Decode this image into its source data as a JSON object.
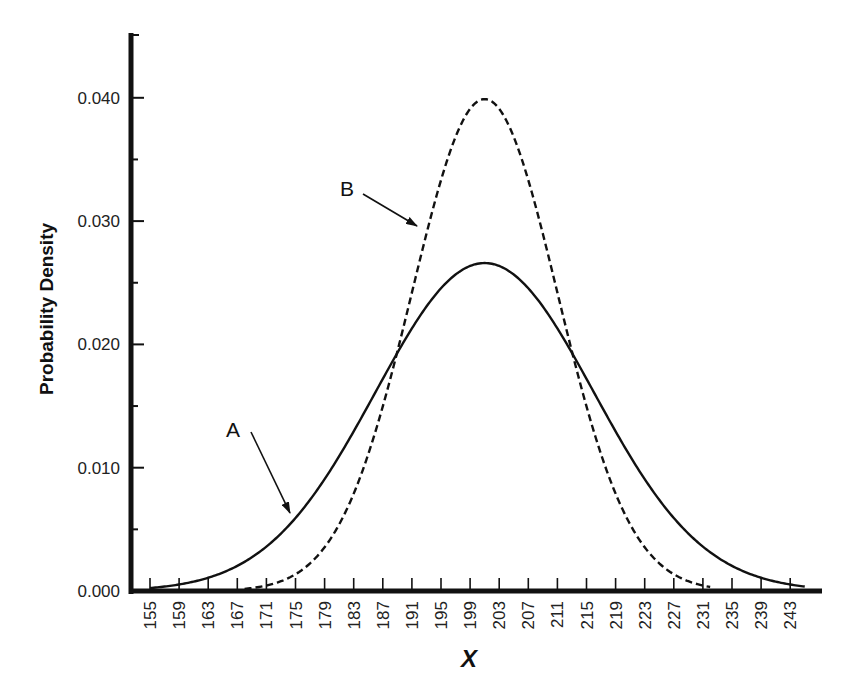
{
  "chart_data": {
    "type": "line",
    "title": "",
    "xlabel": "X",
    "ylabel": "Probability Density",
    "xlim": [
      152,
      249
    ],
    "ylim": [
      0,
      0.0455
    ],
    "grid": false,
    "legend": null,
    "x_ticks": [
      155,
      159,
      163,
      167,
      171,
      175,
      179,
      183,
      187,
      191,
      195,
      199,
      203,
      207,
      211,
      215,
      219,
      223,
      227,
      231,
      235,
      239,
      243
    ],
    "y_ticks": [
      {
        "value": 0.0,
        "label": "0.000"
      },
      {
        "value": 0.01,
        "label": "0.010"
      },
      {
        "value": 0.02,
        "label": "0.020"
      },
      {
        "value": 0.03,
        "label": "0.030"
      },
      {
        "value": 0.04,
        "label": "0.040"
      }
    ],
    "y_minor_ticks": [
      0.005,
      0.015,
      0.025,
      0.035
    ],
    "series": [
      {
        "name": "A",
        "style": "solid",
        "distribution": "normal",
        "mean": 201,
        "sd": 15,
        "x_range": [
          155,
          245
        ],
        "peak": 0.0266
      },
      {
        "name": "B",
        "style": "dashed",
        "distribution": "normal",
        "mean": 201,
        "sd": 10,
        "x_range": [
          168,
          232
        ],
        "peak": 0.0399
      }
    ],
    "annotations": [
      {
        "label": "A",
        "text_pos": [
          233,
          437
        ],
        "arrow_from": [
          251,
          432
        ],
        "arrow_to": [
          290,
          513
        ]
      },
      {
        "label": "B",
        "text_pos": [
          347,
          196
        ],
        "arrow_from": [
          363,
          194
        ],
        "arrow_to": [
          417,
          226
        ]
      }
    ]
  }
}
